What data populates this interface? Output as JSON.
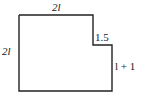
{
  "figure": {
    "shape": "L-shaped polygon (rectangle with top-right corner notch)",
    "labels": {
      "top": "2l",
      "left": "2l",
      "notch": "1.5",
      "right": "l + 1"
    },
    "stroke_color": "#222222"
  }
}
